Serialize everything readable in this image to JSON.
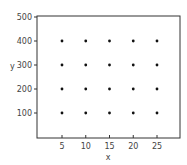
{
  "chart_data": {
    "type": "scatter",
    "title": "",
    "xlabel": "x",
    "ylabel": "y",
    "xlim": [
      0,
      30
    ],
    "ylim": [
      0,
      500
    ],
    "xticks": [
      5,
      10,
      15,
      20,
      25
    ],
    "yticks": [
      100,
      200,
      300,
      400,
      500
    ],
    "grid": false,
    "legend": null,
    "points": [
      {
        "x": 5,
        "y": 100
      },
      {
        "x": 10,
        "y": 100
      },
      {
        "x": 15,
        "y": 100
      },
      {
        "x": 20,
        "y": 100
      },
      {
        "x": 25,
        "y": 100
      },
      {
        "x": 5,
        "y": 200
      },
      {
        "x": 10,
        "y": 200
      },
      {
        "x": 15,
        "y": 200
      },
      {
        "x": 20,
        "y": 200
      },
      {
        "x": 25,
        "y": 200
      },
      {
        "x": 5,
        "y": 300
      },
      {
        "x": 10,
        "y": 300
      },
      {
        "x": 15,
        "y": 300
      },
      {
        "x": 20,
        "y": 300
      },
      {
        "x": 25,
        "y": 300
      },
      {
        "x": 5,
        "y": 400
      },
      {
        "x": 10,
        "y": 400
      },
      {
        "x": 15,
        "y": 400
      },
      {
        "x": 20,
        "y": 400
      },
      {
        "x": 25,
        "y": 400
      }
    ]
  }
}
